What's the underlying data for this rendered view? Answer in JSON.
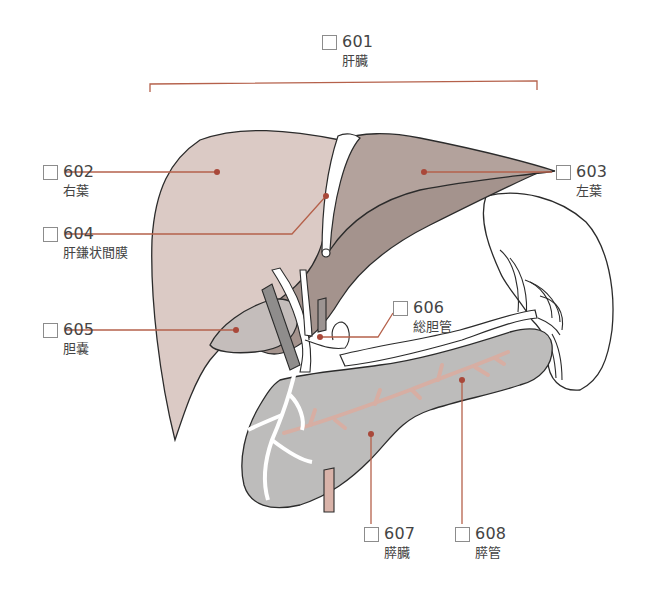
{
  "diagram": {
    "colors": {
      "liver_right": "#d9c7c2",
      "liver_left": "#b3a39d",
      "liver_underside": "#9e8e88",
      "gallbladder": "#c4bdbb",
      "pancreas": "#bdbcbb",
      "spleen": "#ffffff",
      "duct": "#e8c9c0",
      "leader_line": "#b5614b",
      "outline": "#2b2b2b"
    },
    "labels": [
      {
        "id": "601",
        "number": "601",
        "name": "肝臓"
      },
      {
        "id": "602",
        "number": "602",
        "name": "右葉"
      },
      {
        "id": "603",
        "number": "603",
        "name": "左葉"
      },
      {
        "id": "604",
        "number": "604",
        "name": "肝鎌状間膜"
      },
      {
        "id": "605",
        "number": "605",
        "name": "胆嚢"
      },
      {
        "id": "606",
        "number": "606",
        "name": "総胆管"
      },
      {
        "id": "607",
        "number": "607",
        "name": "膵臓"
      },
      {
        "id": "608",
        "number": "608",
        "name": "膵管"
      }
    ]
  }
}
